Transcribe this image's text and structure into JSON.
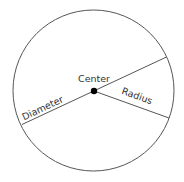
{
  "diagram": {
    "labels": {
      "center": "Center",
      "diameter": "Diameter",
      "radius": "Radius"
    },
    "colors": {
      "stroke": "#555555",
      "dot": "#000000",
      "text": "#333333",
      "background": "#ffffff"
    },
    "geometry": {
      "circle": {
        "cx": 93.5,
        "cy": 90.5,
        "r": 80.5
      },
      "center_dot": {
        "cx": 94,
        "cy": 91,
        "r": 3.2
      },
      "diameter": {
        "x1": 22,
        "y1": 124.5,
        "x2": 166.5,
        "y2": 57
      },
      "radius": {
        "x1": 94,
        "y1": 91,
        "x2": 169,
        "y2": 118
      }
    }
  }
}
